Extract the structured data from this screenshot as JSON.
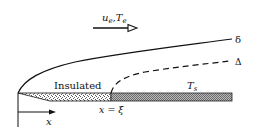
{
  "diagram": {
    "flow_label": {
      "u": "u",
      "u_sub": "e",
      "sep": ",",
      "T": "T",
      "T_sub": "e"
    },
    "curves": {
      "velocity_bl_label": "δ",
      "thermal_bl_label": "Δ"
    },
    "regions": {
      "insulated_label": "Insulated",
      "heated_label_T": "T",
      "heated_label_sub": "s"
    },
    "positions": {
      "xi_label": "x = ξ",
      "x_axis_label": "x"
    },
    "colors": {
      "line": "#111111",
      "plate_heated": "#9a9a9a",
      "plate_insulated": "#d8d8d8"
    }
  }
}
